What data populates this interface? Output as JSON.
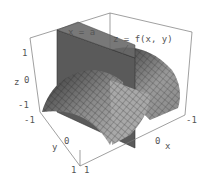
{
  "figure": {
    "labels": {
      "plane": "x = a",
      "surface": "z = f(x, y)"
    },
    "axes": {
      "z": {
        "label": "z",
        "ticks": [
          "1",
          "0",
          "-1"
        ]
      },
      "y": {
        "label": "y",
        "ticks": [
          "-1",
          "0",
          "1"
        ]
      },
      "x": {
        "label": "x",
        "ticks": [
          "1",
          "0",
          "-1"
        ]
      }
    },
    "colors": {
      "plane": "#555555",
      "surface_light": "#aaaaaa",
      "surface_dark": "#3a3a3a",
      "box": "#777777",
      "text": "#555555"
    }
  }
}
